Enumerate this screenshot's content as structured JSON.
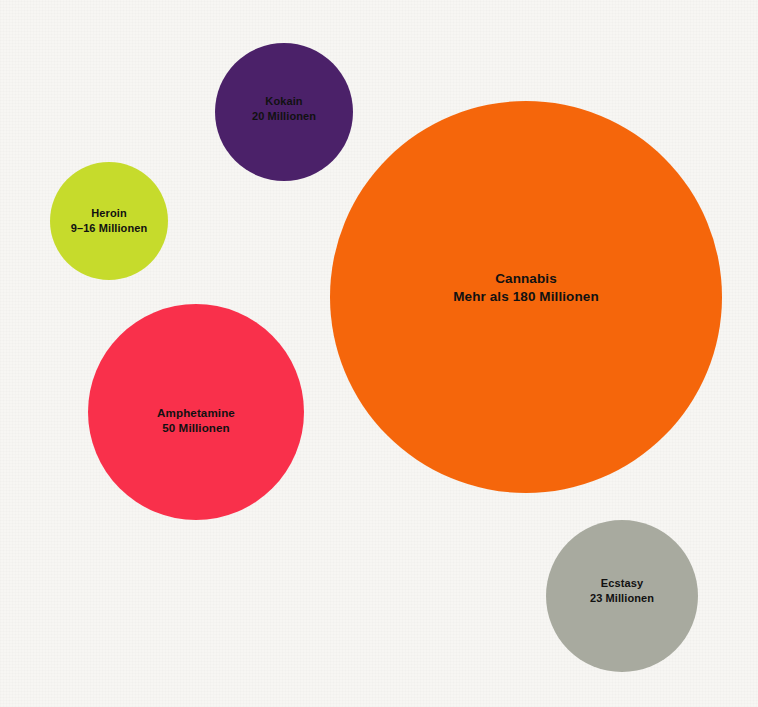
{
  "canvas": {
    "width": 758,
    "height": 707,
    "background_color": "#f7f6f3",
    "label_text_color": "#111111"
  },
  "chart_data": {
    "type": "bubble",
    "title": "",
    "subtitle": "",
    "xlabel": "",
    "ylabel": "",
    "grid": false,
    "legend": "none",
    "unit_label": "Millionen",
    "value_encoding": "circle area proportional to number of users",
    "categories": [
      "Heroin",
      "Kokain",
      "Cannabis",
      "Amphetamine",
      "Ecstasy"
    ],
    "values": [
      12.5,
      20,
      180,
      50,
      23
    ],
    "bubbles": [
      {
        "name": "Heroin",
        "value_label": "9–16 Millionen",
        "value_min": 9,
        "value_max": 16,
        "color": "#c6db2c",
        "cx": 109,
        "cy": 221,
        "diameter": 118,
        "label_offset_y": 0
      },
      {
        "name": "Kokain",
        "value_label": "20 Millionen",
        "value_min": 20,
        "value_max": 20,
        "color": "#4b2169",
        "cx": 284,
        "cy": 112,
        "diameter": 138,
        "label_offset_y": -3
      },
      {
        "name": "Cannabis",
        "value_label": "Mehr als 180 Millionen",
        "value_min": 180,
        "value_max": 180,
        "color": "#f5660b",
        "cx": 526,
        "cy": 297,
        "diameter": 392,
        "label_offset_y": -9
      },
      {
        "name": "Amphetamine",
        "value_label": "50 Millionen",
        "value_min": 50,
        "value_max": 50,
        "color": "#f9304b",
        "cx": 196,
        "cy": 412,
        "diameter": 216,
        "label_offset_y": 8
      },
      {
        "name": "Ecstasy",
        "value_label": "23 Millionen",
        "value_min": 23,
        "value_max": 23,
        "color": "#a8aa9f",
        "cx": 622,
        "cy": 596,
        "diameter": 152,
        "label_offset_y": -5
      }
    ]
  }
}
